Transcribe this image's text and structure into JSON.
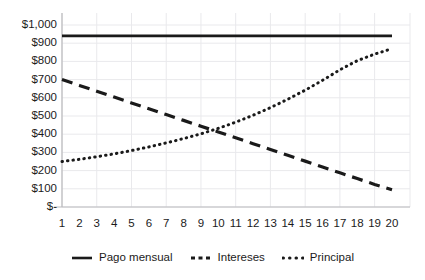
{
  "chart_data": {
    "type": "line",
    "title": "",
    "xlabel": "",
    "ylabel": "",
    "x": [
      1,
      2,
      3,
      4,
      5,
      6,
      7,
      8,
      9,
      10,
      11,
      12,
      13,
      14,
      15,
      16,
      17,
      18,
      19,
      20
    ],
    "xlim": [
      1,
      20
    ],
    "ylim": [
      0,
      1000
    ],
    "grid": true,
    "legend_position": "bottom",
    "xtick_labels": [
      "1",
      "2",
      "3",
      "4",
      "5",
      "6",
      "7",
      "8",
      "9",
      "10",
      "11",
      "12",
      "13",
      "14",
      "15",
      "16",
      "17",
      "18",
      "19",
      "20"
    ],
    "ytick_labels": [
      "$1,000",
      "$900",
      "$800",
      "$700",
      "$600",
      "$500",
      "$400",
      "$300",
      "$200",
      "$100",
      "$-"
    ],
    "ytick_values": [
      1000,
      900,
      800,
      700,
      600,
      500,
      400,
      300,
      200,
      100,
      0
    ],
    "series": [
      {
        "name": "Pago mensual",
        "style": "solid",
        "color": "#1a1a1a",
        "values": [
          940,
          940,
          940,
          940,
          940,
          940,
          940,
          940,
          940,
          940,
          940,
          940,
          940,
          940,
          940,
          940,
          940,
          940,
          940,
          940
        ]
      },
      {
        "name": "Intereses",
        "style": "dashed",
        "color": "#1a1a1a",
        "values": [
          700,
          668,
          636,
          604,
          572,
          540,
          508,
          476,
          444,
          412,
          380,
          348,
          316,
          284,
          252,
          220,
          188,
          156,
          124,
          95
        ]
      },
      {
        "name": "Principal",
        "style": "dotted",
        "color": "#1a1a1a",
        "values": [
          250,
          262,
          276,
          292,
          310,
          330,
          352,
          376,
          402,
          432,
          466,
          504,
          546,
          592,
          642,
          696,
          754,
          804,
          840,
          870
        ]
      }
    ]
  },
  "legend": {
    "items": [
      {
        "label": "Pago mensual",
        "marker": "solid-line-marker"
      },
      {
        "label": "Intereses",
        "marker": "dashed-line-marker"
      },
      {
        "label": "Principal",
        "marker": "dotted-line-marker"
      }
    ]
  },
  "colors": {
    "ink": "#1a1a1a",
    "grid": "#e9e9ec",
    "axis": "#b9b9bd",
    "background": "#ffffff"
  }
}
